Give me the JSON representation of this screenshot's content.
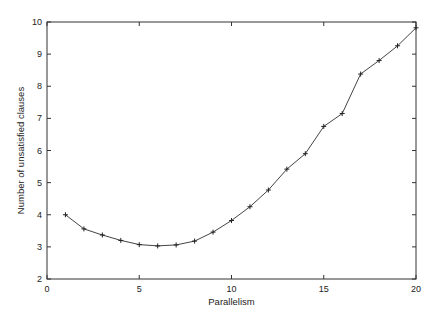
{
  "chart_data": {
    "type": "line",
    "title": "",
    "xlabel": "Parallelism",
    "ylabel": "Number of unsatisfied clauses",
    "xlim": [
      0,
      20
    ],
    "ylim": [
      2,
      10
    ],
    "xticks": [
      0,
      5,
      10,
      15,
      20
    ],
    "yticks": [
      2,
      3,
      4,
      5,
      6,
      7,
      8,
      9,
      10
    ],
    "grid": false,
    "legend": null,
    "series": [
      {
        "name": "unsatisfied clauses",
        "marker": "+",
        "color": "#333333",
        "x": [
          1,
          2,
          3,
          4,
          5,
          6,
          7,
          8,
          9,
          10,
          11,
          12,
          13,
          14,
          15,
          16,
          17,
          18,
          19,
          20
        ],
        "y": [
          4.0,
          3.56,
          3.37,
          3.2,
          3.07,
          3.03,
          3.06,
          3.18,
          3.46,
          3.82,
          4.25,
          4.77,
          5.42,
          5.9,
          6.75,
          7.15,
          8.38,
          8.8,
          9.26,
          9.82
        ]
      }
    ]
  },
  "plot": {
    "left": 47,
    "right": 416,
    "top": 22,
    "bottom": 279
  }
}
